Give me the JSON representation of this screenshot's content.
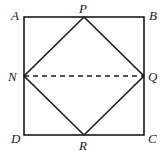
{
  "diagram": {
    "type": "geometry",
    "stroke_color": "#1a1a1a",
    "background": "#ffffff",
    "points": {
      "A": {
        "label": "A",
        "x": 24,
        "y": 17
      },
      "B": {
        "label": "B",
        "x": 144,
        "y": 17
      },
      "C": {
        "label": "C",
        "x": 144,
        "y": 135
      },
      "D": {
        "label": "D",
        "x": 24,
        "y": 135
      },
      "P": {
        "label": "P",
        "x": 84,
        "y": 17
      },
      "Q": {
        "label": "Q",
        "x": 144,
        "y": 76
      },
      "R": {
        "label": "R",
        "x": 84,
        "y": 135
      },
      "N": {
        "label": "N",
        "x": 24,
        "y": 76
      }
    },
    "segments": [
      {
        "from": "A",
        "to": "B",
        "style": "solid"
      },
      {
        "from": "B",
        "to": "C",
        "style": "solid"
      },
      {
        "from": "C",
        "to": "D",
        "style": "solid"
      },
      {
        "from": "D",
        "to": "A",
        "style": "solid"
      },
      {
        "from": "P",
        "to": "Q",
        "style": "solid"
      },
      {
        "from": "Q",
        "to": "R",
        "style": "solid"
      },
      {
        "from": "R",
        "to": "N",
        "style": "solid"
      },
      {
        "from": "N",
        "to": "P",
        "style": "solid"
      },
      {
        "from": "N",
        "to": "Q",
        "style": "dashed"
      }
    ]
  }
}
